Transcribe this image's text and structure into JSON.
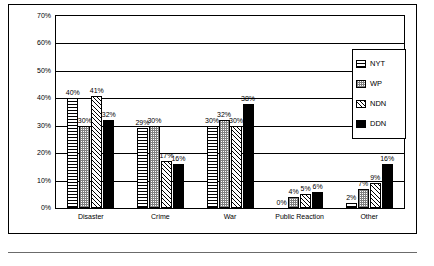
{
  "chart_data": {
    "type": "bar",
    "title": "",
    "subtitle": "",
    "xlabel": "",
    "ylabel": "",
    "ylim": [
      0,
      70
    ],
    "y_ticks": [
      "0%",
      "10%",
      "20%",
      "30%",
      "40%",
      "50%",
      "60%",
      "70%"
    ],
    "y_tick_values": [
      0,
      10,
      20,
      30,
      40,
      50,
      60,
      70
    ],
    "grid": true,
    "legend_position": "right",
    "categories": [
      "Disaster",
      "Crime",
      "War",
      "Public Reaction",
      "Other"
    ],
    "series": [
      {
        "name": "NYT",
        "fill": "horizontal-lines",
        "values": [
          40,
          29,
          30,
          0,
          2
        ],
        "labels": [
          "40%",
          "29%",
          "30%",
          "0%",
          "2%"
        ]
      },
      {
        "name": "WP",
        "fill": "cross-hatch-grey",
        "values": [
          30,
          30,
          32,
          4,
          7
        ],
        "labels": [
          "30%",
          "30%",
          "32%",
          "4%",
          "7%"
        ]
      },
      {
        "name": "NDN",
        "fill": "diagonal-lines",
        "values": [
          41,
          17,
          30,
          5,
          9
        ],
        "labels": [
          "41%",
          "17%",
          "30%",
          "5%",
          "9%"
        ]
      },
      {
        "name": "DDN",
        "fill": "solid-black",
        "values": [
          32,
          16,
          38,
          6,
          16
        ],
        "labels": [
          "32%",
          "16%",
          "38%",
          "6%",
          "16%"
        ]
      }
    ]
  },
  "legend": {
    "items": [
      {
        "label": "NYT"
      },
      {
        "label": "WP"
      },
      {
        "label": "NDN"
      },
      {
        "label": "DDN"
      }
    ]
  },
  "colors": {
    "axis": "#000000",
    "background": "#ffffff",
    "ddn_fill": "#000000",
    "wp_fill": "#808080"
  }
}
